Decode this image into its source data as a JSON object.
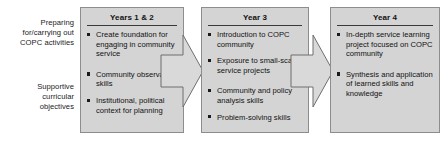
{
  "diagram": {
    "row_labels": [
      {
        "name": "preparing",
        "lines": [
          "Preparing",
          "for/carrying out",
          "COPC activities"
        ]
      },
      {
        "name": "supportive",
        "lines": [
          "Supportive",
          "curricular",
          "objectives"
        ]
      }
    ],
    "stages": [
      {
        "id": "years12",
        "title": "Years 1 & 2",
        "bullets": [
          "Create foundation for engaging in community service",
          "Community observation skills",
          "Institutional, political context for planning"
        ]
      },
      {
        "id": "year3",
        "title": "Year 3",
        "bullets": [
          "Introduction to COPC community",
          "Exposure to small-scale service projects",
          "Community and policy analysis skills",
          "Problem-solving skills"
        ]
      },
      {
        "id": "year4",
        "title": "Year 4",
        "bullets": [
          "In-depth service learning project focused on COPC community",
          "Synthesis and application of learned skills and knowledge"
        ]
      }
    ],
    "arrows": [
      {
        "id": "arrow-years12-to-year3",
        "direction": "right"
      },
      {
        "id": "arrow-year3-to-year4",
        "direction": "right"
      }
    ],
    "colors": {
      "box_fill": "#d4d4d4",
      "box_border": "#8d8d8d",
      "arrow_fill": "#d9d9d9",
      "arrow_border": "#6f6f6f",
      "text": "#111111",
      "background": "#ffffff"
    }
  }
}
